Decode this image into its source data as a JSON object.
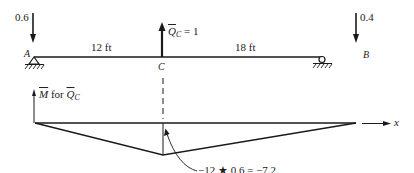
{
  "diagram": {
    "type": "beam influence / moment diagram",
    "beam": {
      "left_support_label": "A",
      "right_support_label": "B",
      "point_label": "C",
      "span_left": "12 ft",
      "span_right": "18 ft"
    },
    "loads": {
      "left_reaction_value": "0.6",
      "right_reaction_value": "0.4",
      "virtual_load_symbol": "Q",
      "virtual_load_subscript": "C",
      "virtual_load_eq": " = 1"
    },
    "moment_diagram": {
      "label_symbol": "M",
      "label_mid": " for ",
      "label_q": "Q",
      "label_q_sub": "C",
      "axis_label": "x",
      "annotation": "−12 ★ 0.6 = −7.2"
    },
    "colors": {
      "line": "#1a1a1a",
      "background": "#ffffff"
    }
  }
}
